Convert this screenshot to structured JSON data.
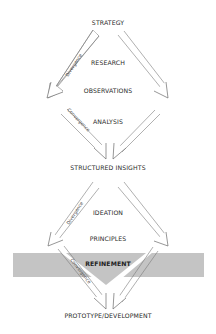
{
  "diagram": {
    "title": "",
    "stages": [
      {
        "id": "strategy",
        "label": "STRATEGY",
        "y": 22
      },
      {
        "id": "research",
        "label": "RESEARCH",
        "y": 62
      },
      {
        "id": "observations",
        "label": "OBSERVATIONS",
        "y": 90
      },
      {
        "id": "analysis",
        "label": "ANALYSIS",
        "y": 121
      },
      {
        "id": "structured_insights",
        "label": "STRUCTURED INSIGHTS",
        "y": 167
      },
      {
        "id": "ideation",
        "label": "IDEATION",
        "y": 212
      },
      {
        "id": "principles",
        "label": "PRINCIPLES",
        "y": 238
      },
      {
        "id": "refinement",
        "label": "REFINEMENT",
        "y": 263
      },
      {
        "id": "prototype_development",
        "label": "PROTOTYPE/DEVELOPMENT",
        "y": 315
      }
    ],
    "arrow_labels": {
      "divergence_1": "Divergence",
      "convergence_1": "Convergence",
      "divergence_2": "Divergence",
      "convergence_2": "Convergence"
    },
    "colors": {
      "band": "#c4c4c4",
      "arrow_stroke": "#6a6a6a",
      "text": "#2a2a2a"
    }
  }
}
